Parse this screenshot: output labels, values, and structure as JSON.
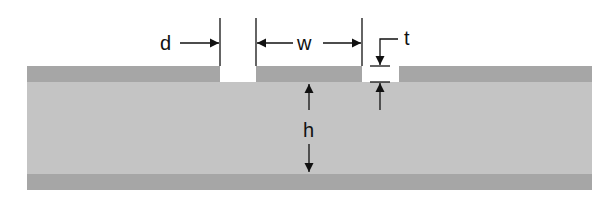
{
  "diagram": {
    "type": "cross-section",
    "labels": {
      "gap": "d",
      "trace_width": "w",
      "conductor_thickness": "t",
      "substrate_height": "h"
    },
    "layers": [
      {
        "name": "top-conductor",
        "color": "#a6a6a6"
      },
      {
        "name": "dielectric-substrate",
        "color": "#c4c4c4"
      },
      {
        "name": "ground-plane",
        "color": "#a6a6a6"
      }
    ],
    "colors": {
      "background": "#ffffff",
      "conductor": "#a6a6a6",
      "substrate": "#c4c4c4",
      "annotation": "#111111"
    }
  }
}
